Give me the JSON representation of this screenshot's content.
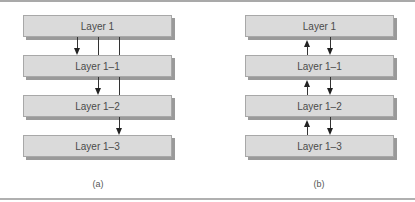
{
  "diagram_a": {
    "caption": "(a)",
    "layers": [
      "Layer 1",
      "Layer 1–1",
      "Layer 1–2",
      "Layer 1–3"
    ],
    "flow": "one-way downward calls; Layer 1 calls Layer 1–1, 1–2, 1–3 directly via vertical lines"
  },
  "diagram_b": {
    "caption": "(b)",
    "layers": [
      "Layer 1",
      "Layer 1–1",
      "Layer 1–2",
      "Layer 1–3"
    ],
    "flow": "two-way arrows between adjacent layers only (up and down)"
  },
  "colors": {
    "box_fill": "#dadada",
    "box_shadow": "#9a9a9a",
    "arrow": "#222222",
    "text": "#4a4a4a"
  }
}
